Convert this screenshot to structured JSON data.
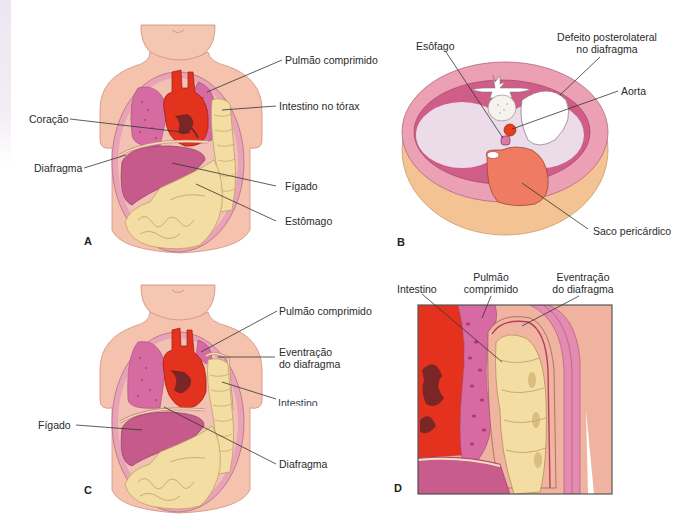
{
  "figure": {
    "panels": [
      {
        "letter": "A",
        "type": "frontal-view",
        "labels": {
          "pulmao": "Pulmão comprimido",
          "intestino": "Intestino no tórax",
          "coracao": "Coração",
          "diafragma": "Diafragma",
          "figado": "Fígado",
          "estomago": "Estômago"
        }
      },
      {
        "letter": "B",
        "type": "cross-section",
        "labels": {
          "esofago": "Esôfago",
          "defeito_l1": "Defeito posterolateral",
          "defeito_l2": "no diafragma",
          "aorta": "Aorta",
          "saco": "Saco pericárdico"
        }
      },
      {
        "letter": "C",
        "type": "frontal-view",
        "labels": {
          "pulmao": "Pulmão comprimido",
          "eventracao_l1": "Eventração",
          "eventracao_l2": "do diafragma",
          "intestino": "Intestino",
          "figado": "Fígado",
          "diafragma": "Diafragma"
        }
      },
      {
        "letter": "D",
        "type": "detail-view",
        "labels": {
          "intestino": "Intestino",
          "pulmao_l1": "Pulmão",
          "pulmao_l2": "comprimido",
          "eventracao_l1": "Eventração",
          "eventracao_l2": "do diafragma"
        }
      }
    ]
  },
  "colors": {
    "skin": "#f5c3ad",
    "skin_dark": "#eaa994",
    "body_wall": "#e9a3b6",
    "lung": "#d6669a",
    "heart": "#e4301e",
    "heart_dark": "#7a2626",
    "liver": "#c75a8a",
    "intestine": "#f4deA2",
    "pericardium": "#ee7660",
    "cavity": "#ead9e8",
    "fat": "#f4c596"
  }
}
